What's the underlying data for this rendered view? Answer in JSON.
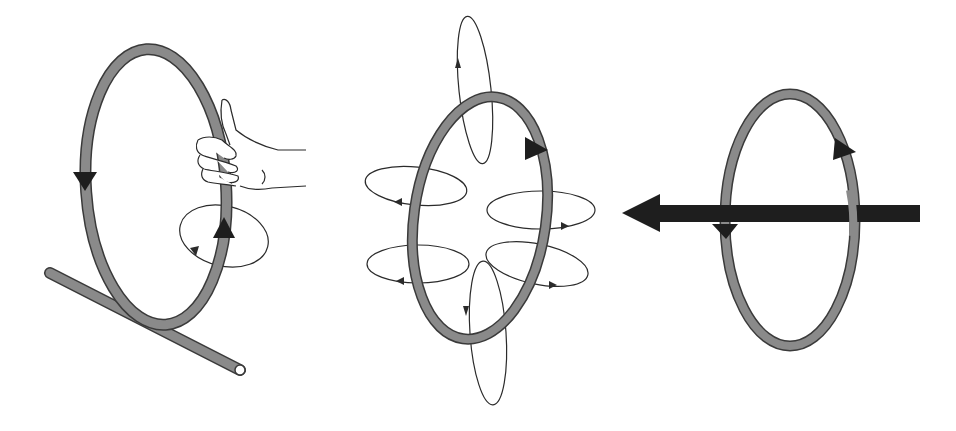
{
  "diagram": {
    "title": "Magnetic field around a current-carrying circular loop",
    "panels": [
      {
        "id": "right-hand-grip",
        "description": "Loop held by right hand; thumb along current, field circles around wire"
      },
      {
        "id": "field-lines",
        "description": "Circular field lines around each segment of the loop"
      },
      {
        "id": "net-field",
        "description": "Net magnetic field through center of loop shown as a thick arrow pointing left"
      }
    ],
    "colors": {
      "loop_fill": "#8a8a8a",
      "loop_outline": "#3a3a3a",
      "arrow": "#1e1e1e",
      "field_line": "#2b2b2b",
      "background": "#ffffff"
    }
  }
}
